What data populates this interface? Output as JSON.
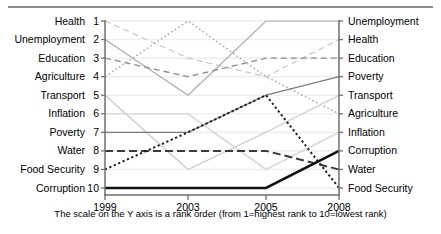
{
  "chart_data": {
    "type": "line",
    "title": "",
    "subtitle": "",
    "caption": "The scale on the Y axis is a rank order (from 1=highest rank to 10=lowest rank)",
    "xlabel": "",
    "ylabel": "",
    "x": [
      "1999",
      "2003",
      "2005",
      "2008"
    ],
    "ylim": [
      1,
      10
    ],
    "y_inverted": true,
    "ytick_values": [
      "1",
      "2",
      "3",
      "4",
      "5",
      "6",
      "7",
      "8",
      "9",
      "10"
    ],
    "grid": true,
    "legend": "axis-labels-both-sides",
    "left_axis_labels": [
      "Health",
      "Unemployment",
      "Education",
      "Agriculture",
      "Transport",
      "Inflation",
      "Poverty",
      "Water",
      "Food Security",
      "Corruption"
    ],
    "right_axis_labels": [
      "Unemployment",
      "Health",
      "Education",
      "Poverty",
      "Transport",
      "Agriculture",
      "Inflation",
      "Corruption",
      "Water",
      "Food Security"
    ],
    "series": [
      {
        "name": "Health",
        "values": [
          1,
          3,
          4,
          2
        ],
        "style": "dashed",
        "weight": 1.1,
        "color": "#c3c3c3"
      },
      {
        "name": "Unemployment",
        "values": [
          2,
          5,
          1,
          1
        ],
        "style": "solid",
        "weight": 1.1,
        "color": "#a8a8a8"
      },
      {
        "name": "Education",
        "values": [
          3,
          4,
          3,
          3
        ],
        "style": "dashed",
        "weight": 1.4,
        "color": "#8f8f8f"
      },
      {
        "name": "Agriculture",
        "values": [
          4,
          1,
          4,
          6
        ],
        "style": "dotted",
        "weight": 1.5,
        "color": "#b0b0b0"
      },
      {
        "name": "Transport",
        "values": [
          5,
          9,
          7,
          5
        ],
        "style": "solid",
        "weight": 1.2,
        "color": "#c9c9c9"
      },
      {
        "name": "Inflation",
        "values": [
          6,
          6,
          9,
          7
        ],
        "style": "solid",
        "weight": 1.6,
        "color": "#d9d9d9"
      },
      {
        "name": "Poverty",
        "values": [
          7,
          7,
          5,
          4
        ],
        "style": "solid",
        "weight": 1.3,
        "color": "#7d7d7d"
      },
      {
        "name": "Water",
        "values": [
          8,
          8,
          8,
          9
        ],
        "style": "dashed",
        "weight": 2.0,
        "color": "#3a3a3a"
      },
      {
        "name": "Food Security",
        "values": [
          9,
          7,
          5,
          10
        ],
        "style": "dotted",
        "weight": 2.0,
        "color": "#1d1d1d"
      },
      {
        "name": "Corruption",
        "values": [
          10,
          10,
          10,
          8
        ],
        "style": "solid",
        "weight": 2.6,
        "color": "#111111"
      }
    ]
  },
  "colors": {
    "axis": "#6f6f6f",
    "grid": "#efefef",
    "text": "#000000",
    "rule": "#8a8a8a"
  }
}
